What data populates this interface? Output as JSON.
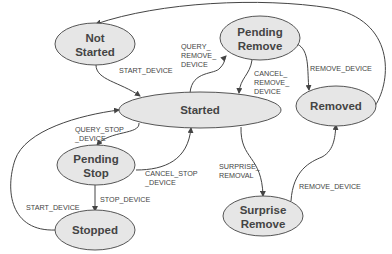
{
  "diagram": {
    "type": "state-machine",
    "nodes": {
      "not_started": {
        "line1": "Not",
        "line2": "Started"
      },
      "pending_remove": {
        "line1": "Pending",
        "line2": "Remove"
      },
      "started": {
        "line1": "Started"
      },
      "removed": {
        "line1": "Removed"
      },
      "pending_stop": {
        "line1": "Pending",
        "line2": "Stop"
      },
      "stopped": {
        "line1": "Stopped"
      },
      "surprise_remove": {
        "line1": "Surprise",
        "line2": "Remove"
      }
    },
    "edges": {
      "start_device_1": {
        "from": "Not Started",
        "to": "Started",
        "label": "START_DEVICE"
      },
      "query_remove": {
        "from": "Started",
        "to": "Pending Remove",
        "l1": "QUERY_",
        "l2": "REMOVE_",
        "l3": "DEVICE"
      },
      "cancel_remove": {
        "from": "Pending Remove",
        "to": "Started",
        "l1": "CANCEL_",
        "l2": "REMOVE_",
        "l3": "DEVICE"
      },
      "remove_device_1": {
        "from": "Pending Remove",
        "to": "Removed",
        "label": "REMOVE_DEVICE"
      },
      "removed_to_not_started": {
        "from": "Removed",
        "to": "Not Started"
      },
      "query_stop": {
        "from": "Started",
        "to": "Pending Stop",
        "l1": "QUERY_STOP",
        "l2": "_DEVICE"
      },
      "cancel_stop": {
        "from": "Pending Stop",
        "to": "Started",
        "l1": "CANCEL_STOP",
        "l2": "_DEVICE"
      },
      "stop_device": {
        "from": "Pending Stop",
        "to": "Stopped",
        "label": "STOP_DEVICE"
      },
      "start_device_2": {
        "from": "Stopped",
        "to": "Started",
        "label": "START_DEVICE"
      },
      "surprise_removal": {
        "from": "Started",
        "to": "Surprise Remove",
        "l1": "SURPRISE_",
        "l2": "REMOVAL"
      },
      "remove_device_2": {
        "from": "Surprise Remove",
        "to": "Removed",
        "label": "REMOVE_DEVICE"
      }
    }
  }
}
